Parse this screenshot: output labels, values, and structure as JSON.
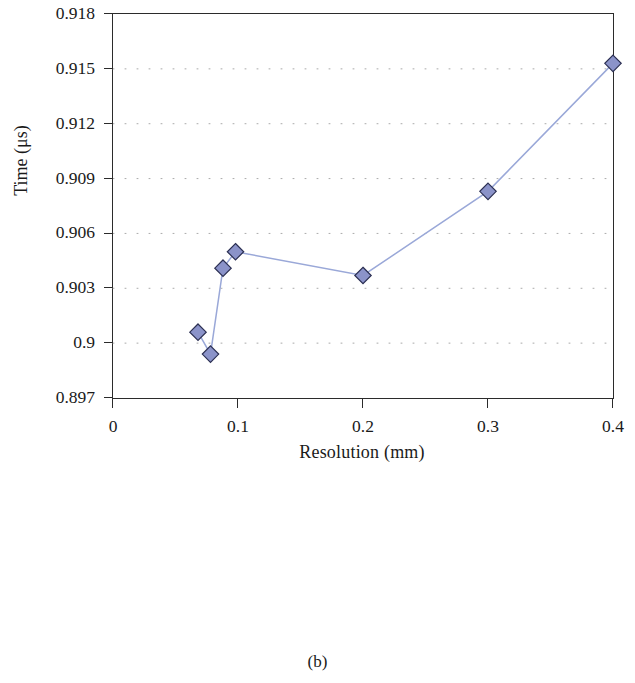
{
  "figure": {
    "caption": "(b)"
  },
  "chart_data": {
    "type": "line",
    "title": "",
    "subtitle": "",
    "xlabel": "Resolution (mm)",
    "ylabel": "Time (μs)",
    "xlim": [
      0,
      0.4
    ],
    "ylim": [
      0.897,
      0.918
    ],
    "xticks": [
      0,
      0.1,
      0.2,
      0.3,
      0.4
    ],
    "xtick_labels": [
      "0",
      "0.1",
      "0.2",
      "0.3",
      "0.4"
    ],
    "yticks": [
      0.897,
      0.9,
      0.903,
      0.906,
      0.909,
      0.912,
      0.915,
      0.918
    ],
    "ytick_labels": [
      "0.897",
      "0.9",
      "0.903",
      "0.906",
      "0.909",
      "0.912",
      "0.915",
      "0.918"
    ],
    "grid": "horizontal-dotted",
    "legend": "none",
    "marker": "diamond",
    "marker_color": "#8b93c9",
    "marker_edge_color": "#2b2f52",
    "line_color": "#9aa8d8",
    "series": [
      {
        "name": "Time vs Resolution",
        "x": [
          0.068,
          0.078,
          0.088,
          0.098,
          0.2,
          0.3,
          0.4
        ],
        "y": [
          0.9006,
          0.8994,
          0.9041,
          0.905,
          0.9037,
          0.9083,
          0.9153
        ]
      }
    ]
  }
}
